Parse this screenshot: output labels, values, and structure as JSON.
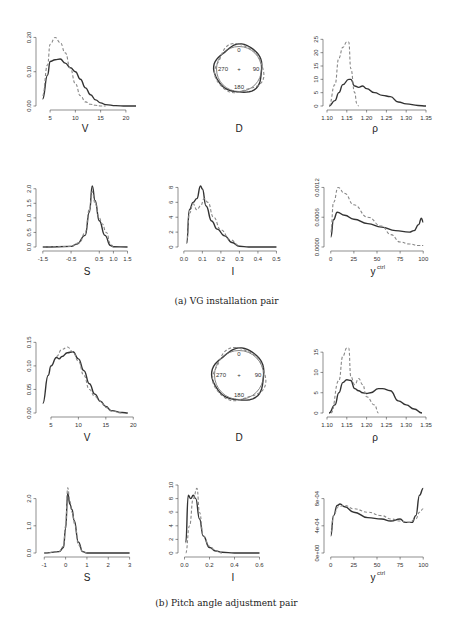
{
  "captions": {
    "a": "(a) VG installation pair",
    "b": "(b) Pitch angle adjustment pair"
  },
  "panels": {
    "a_V": {
      "xlabel": "V"
    },
    "a_D": {
      "xlabel": "D",
      "compass": [
        "0",
        "90",
        "180",
        "270"
      ]
    },
    "a_rho": {
      "xlabel": "ρ"
    },
    "a_S": {
      "xlabel": "S"
    },
    "a_I": {
      "xlabel": "I"
    },
    "a_y": {
      "xlabel": "y",
      "xlabel_sup": "ctrl"
    },
    "b_V": {
      "xlabel": "V"
    },
    "b_D": {
      "xlabel": "D",
      "compass": [
        "0",
        "90",
        "180",
        "270"
      ]
    },
    "b_rho": {
      "xlabel": "ρ"
    },
    "b_S": {
      "xlabel": "S"
    },
    "b_I": {
      "xlabel": "I"
    },
    "b_y": {
      "xlabel": "y",
      "xlabel_sup": "ctrl"
    }
  },
  "chart_data": [
    {
      "id": "a_V",
      "type": "line",
      "group": "(a) VG installation pair",
      "xlabel": "V",
      "ylabel": "",
      "xlim": [
        3,
        22
      ],
      "ylim": [
        0,
        0.21
      ],
      "xticks": [
        5,
        10,
        15,
        20
      ],
      "yticks": [
        "0.00",
        "0.10",
        "0.20"
      ],
      "series": [
        {
          "name": "solid",
          "x": [
            3.5,
            4.5,
            5,
            6,
            7,
            8,
            9,
            10,
            11,
            12,
            13,
            14,
            15,
            16,
            18,
            20,
            22
          ],
          "values": [
            0.02,
            0.09,
            0.13,
            0.135,
            0.137,
            0.125,
            0.112,
            0.1,
            0.078,
            0.053,
            0.033,
            0.018,
            0.009,
            0.004,
            0.001,
            0.0,
            0.0
          ]
        },
        {
          "name": "dashed",
          "x": [
            3.5,
            4.5,
            5,
            6,
            7,
            8,
            9,
            10,
            11,
            12,
            13,
            14,
            15,
            16
          ],
          "values": [
            0.03,
            0.12,
            0.18,
            0.2,
            0.185,
            0.155,
            0.11,
            0.065,
            0.03,
            0.012,
            0.005,
            0.002,
            0.0,
            0.0
          ]
        }
      ]
    },
    {
      "id": "a_D",
      "type": "polar",
      "group": "(a) VG installation pair",
      "xlabel": "D",
      "angles": [
        "0",
        "90",
        "180",
        "270"
      ],
      "series": [
        {
          "name": "solid",
          "shape": "near-circular"
        },
        {
          "name": "dashed",
          "shape": "near-circular"
        }
      ]
    },
    {
      "id": "a_rho",
      "type": "line",
      "group": "(a) VG installation pair",
      "xlabel": "ρ",
      "xlim": [
        1.1,
        1.35
      ],
      "ylim": [
        0,
        27
      ],
      "xticks": [
        "1.10",
        "1.15",
        "1.20",
        "1.25",
        "1.30",
        "1.35"
      ],
      "yticks": [
        0,
        5,
        10,
        15,
        20,
        25
      ],
      "series": [
        {
          "name": "solid",
          "x": [
            1.105,
            1.12,
            1.13,
            1.14,
            1.155,
            1.16,
            1.17,
            1.18,
            1.19,
            1.2,
            1.22,
            1.24,
            1.26,
            1.28,
            1.3,
            1.33,
            1.35
          ],
          "values": [
            0,
            2,
            5,
            8,
            10,
            10,
            7.5,
            7,
            7.5,
            6.5,
            5,
            4,
            3.5,
            1.5,
            0.8,
            0.2,
            0
          ]
        },
        {
          "name": "dashed",
          "x": [
            1.105,
            1.12,
            1.13,
            1.14,
            1.15,
            1.155,
            1.16,
            1.17,
            1.175,
            1.18
          ],
          "values": [
            0,
            8,
            18,
            22,
            24,
            24,
            14,
            5,
            1,
            0
          ]
        }
      ]
    },
    {
      "id": "a_S",
      "type": "line",
      "group": "(a) VG installation pair",
      "xlabel": "S",
      "xlim": [
        -1.6,
        1.8
      ],
      "ylim": [
        0,
        2.3
      ],
      "xticks": [
        "-1.5",
        "-0.5",
        "0.5",
        "1.0",
        "1.5"
      ],
      "yticks": [
        "0.0",
        "0.5",
        "1.0",
        "1.5",
        "2.0"
      ],
      "series": [
        {
          "name": "solid",
          "x": [
            -1.5,
            -0.5,
            -0.3,
            0,
            0.15,
            0.25,
            0.35,
            0.5,
            0.7,
            0.9,
            1.0,
            1.5
          ],
          "values": [
            0,
            0.02,
            0.1,
            0.4,
            1.2,
            2.1,
            1.6,
            0.9,
            0.4,
            0.05,
            0.01,
            0
          ]
        },
        {
          "name": "dashed",
          "x": [
            -1.5,
            -0.5,
            -0.2,
            0,
            0.15,
            0.25,
            0.35,
            0.5,
            0.6,
            0.75,
            0.9,
            1.0
          ],
          "values": [
            0,
            0.02,
            0.15,
            0.5,
            1.3,
            1.9,
            1.5,
            1.0,
            0.8,
            0.5,
            0.1,
            0
          ]
        }
      ]
    },
    {
      "id": "a_I",
      "type": "line",
      "group": "(a) VG installation pair",
      "xlabel": "I",
      "xlim": [
        -0.01,
        0.53
      ],
      "ylim": [
        0,
        9
      ],
      "xticks": [
        "0.0",
        "0.1",
        "0.2",
        "0.3",
        "0.4",
        "0.5"
      ],
      "yticks": [
        0,
        2,
        4,
        6,
        8
      ],
      "series": [
        {
          "name": "solid",
          "x": [
            0.015,
            0.03,
            0.05,
            0.07,
            0.09,
            0.1,
            0.12,
            0.15,
            0.18,
            0.22,
            0.26,
            0.3,
            0.35,
            0.5
          ],
          "values": [
            0.5,
            5,
            6,
            6.5,
            8.2,
            7.8,
            5.5,
            3.5,
            2.4,
            1.5,
            0.6,
            0.1,
            0,
            0
          ]
        },
        {
          "name": "dashed",
          "x": [
            0.015,
            0.03,
            0.05,
            0.07,
            0.09,
            0.11,
            0.13,
            0.16,
            0.2,
            0.25,
            0.3
          ],
          "values": [
            0.5,
            4.5,
            5.8,
            5,
            5.5,
            6.5,
            6,
            4,
            2.3,
            1,
            0.2
          ]
        }
      ]
    },
    {
      "id": "a_y",
      "type": "line",
      "group": "(a) VG installation pair",
      "xlabel": "y^ctrl",
      "xlim": [
        -3,
        103
      ],
      "ylim": [
        0,
        0.00135
      ],
      "xticks": [
        0,
        25,
        50,
        75,
        100
      ],
      "yticks": [
        "0.0000",
        "0.0006",
        "0.0012"
      ],
      "series": [
        {
          "name": "solid",
          "x": [
            0,
            3,
            7,
            15,
            25,
            40,
            55,
            70,
            85,
            90,
            95,
            98,
            100
          ],
          "values": [
            0.0002,
            0.00055,
            0.0007,
            0.00064,
            0.00056,
            0.00047,
            0.0004,
            0.00033,
            0.0003,
            0.00033,
            0.00045,
            0.00058,
            0.0005
          ]
        },
        {
          "name": "dashed",
          "x": [
            0,
            3,
            8,
            15,
            25,
            40,
            55,
            65,
            75,
            85,
            95,
            100
          ],
          "values": [
            0.0003,
            0.0009,
            0.0012,
            0.00108,
            0.00085,
            0.0006,
            0.00042,
            0.00025,
            0.0001,
            6e-05,
            3e-05,
            3e-05
          ]
        }
      ]
    },
    {
      "id": "b_V",
      "type": "line",
      "group": "(b) Pitch angle adjustment pair",
      "xlabel": "V",
      "xlim": [
        3,
        20.5
      ],
      "ylim": [
        0,
        0.155
      ],
      "xticks": [
        5,
        10,
        15,
        20
      ],
      "yticks": [
        "0.00",
        "0.05",
        "0.10",
        "0.15"
      ],
      "series": [
        {
          "name": "solid",
          "x": [
            3.5,
            4.5,
            5,
            6,
            6.5,
            7,
            8,
            9,
            10,
            11,
            12,
            13,
            14,
            15,
            16,
            18,
            19
          ],
          "values": [
            0.02,
            0.08,
            0.1,
            0.118,
            0.115,
            0.12,
            0.128,
            0.13,
            0.115,
            0.09,
            0.062,
            0.04,
            0.025,
            0.014,
            0.005,
            0.001,
            0
          ]
        },
        {
          "name": "dashed",
          "x": [
            6,
            7,
            8,
            9,
            10,
            11,
            12,
            13,
            14,
            15,
            16,
            18
          ],
          "values": [
            0.12,
            0.135,
            0.14,
            0.13,
            0.11,
            0.08,
            0.05,
            0.035,
            0.025,
            0.012,
            0.004,
            0
          ]
        }
      ]
    },
    {
      "id": "b_D",
      "type": "polar",
      "group": "(b) Pitch angle adjustment pair",
      "xlabel": "D",
      "angles": [
        "0",
        "90",
        "180",
        "270"
      ],
      "series": [
        {
          "name": "solid",
          "shape": "near-circular"
        },
        {
          "name": "dashed",
          "shape": "near-circular"
        }
      ]
    },
    {
      "id": "b_rho",
      "type": "line",
      "group": "(b) Pitch angle adjustment pair",
      "xlabel": "ρ",
      "xlim": [
        1.1,
        1.35
      ],
      "ylim": [
        0,
        18
      ],
      "xticks": [
        "1.10",
        "1.15",
        "1.20",
        "1.25",
        "1.30",
        "1.35"
      ],
      "yticks": [
        0,
        5,
        10,
        15
      ],
      "series": [
        {
          "name": "solid",
          "x": [
            1.105,
            1.12,
            1.13,
            1.14,
            1.15,
            1.16,
            1.17,
            1.18,
            1.19,
            1.2,
            1.21,
            1.23,
            1.24,
            1.26,
            1.28,
            1.3,
            1.32,
            1.34
          ],
          "values": [
            0,
            2,
            5,
            7.5,
            8.2,
            8,
            6,
            5.5,
            5,
            4.8,
            5,
            6,
            6,
            5.5,
            3,
            2,
            1,
            0
          ]
        },
        {
          "name": "dashed",
          "x": [
            1.11,
            1.13,
            1.14,
            1.15,
            1.155,
            1.16,
            1.17,
            1.18,
            1.19,
            1.2,
            1.22,
            1.23
          ],
          "values": [
            0,
            8,
            14,
            16,
            16,
            9,
            7,
            8.5,
            7,
            4,
            2,
            0
          ]
        }
      ]
    },
    {
      "id": "b_S",
      "type": "line",
      "group": "(b) Pitch angle adjustment pair",
      "xlabel": "S",
      "xlim": [
        -1.2,
        3.3
      ],
      "ylim": [
        0,
        2.5
      ],
      "xticks": [
        -1,
        0,
        1,
        2,
        3
      ],
      "yticks": [
        "0.0",
        "1.0",
        "2.0"
      ],
      "series": [
        {
          "name": "solid",
          "x": [
            -1,
            -0.3,
            -0.1,
            0,
            0.1,
            0.2,
            0.3,
            0.4,
            0.6,
            0.8,
            1,
            2,
            3
          ],
          "values": [
            0,
            0.05,
            0.2,
            0.9,
            2.2,
            1.8,
            1.6,
            1.2,
            0.4,
            0.05,
            0,
            0,
            0
          ]
        },
        {
          "name": "dashed",
          "x": [
            -1,
            -0.3,
            -0.1,
            0,
            0.1,
            0.2,
            0.3,
            0.45,
            0.6,
            0.8,
            1
          ],
          "values": [
            0,
            0.05,
            0.25,
            1.0,
            2.4,
            1.9,
            1.5,
            1.0,
            0.3,
            0.05,
            0
          ]
        }
      ]
    },
    {
      "id": "b_I",
      "type": "line",
      "group": "(b) Pitch angle adjustment pair",
      "xlabel": "I",
      "xlim": [
        -0.02,
        0.78
      ],
      "ylim": [
        0,
        10
      ],
      "xticks": [
        "0.0",
        "0.2",
        "0.4",
        "0.6"
      ],
      "yticks": [
        0,
        2,
        4,
        6,
        8,
        10
      ],
      "series": [
        {
          "name": "solid",
          "x": [
            0.01,
            0.03,
            0.05,
            0.07,
            0.09,
            0.12,
            0.15,
            0.2,
            0.25,
            0.3,
            0.4,
            0.6
          ],
          "values": [
            1.5,
            8.5,
            8,
            8.5,
            8,
            5,
            2.5,
            0.8,
            0.3,
            0.1,
            0,
            0
          ]
        },
        {
          "name": "dashed",
          "x": [
            0.01,
            0.04,
            0.07,
            0.1,
            0.12,
            0.15,
            0.2,
            0.25,
            0.3
          ],
          "values": [
            0,
            4,
            8,
            9.5,
            6,
            2.5,
            1,
            0.3,
            0
          ]
        }
      ]
    },
    {
      "id": "b_y",
      "type": "line",
      "group": "(b) Pitch angle adjustment pair",
      "xlabel": "y^ctrl",
      "xlim": [
        -3,
        103
      ],
      "ylim": [
        0,
        0.001
      ],
      "xticks": [
        0,
        25,
        50,
        75,
        100
      ],
      "yticks": [
        "0e+00",
        "4e-04",
        "8e-04"
      ],
      "series": [
        {
          "name": "solid",
          "x": [
            0,
            3,
            7,
            10,
            15,
            25,
            40,
            55,
            65,
            75,
            80,
            88,
            92,
            96,
            100
          ],
          "values": [
            0.00025,
            0.00055,
            0.0007,
            0.00072,
            0.00068,
            0.0006,
            0.00052,
            0.0005,
            0.00047,
            0.0005,
            0.00045,
            0.00045,
            0.00055,
            0.00085,
            0.00095
          ]
        },
        {
          "name": "dashed",
          "x": [
            0,
            3,
            8,
            15,
            25,
            40,
            55,
            65,
            75,
            85,
            92,
            96,
            100
          ],
          "values": [
            0.0003,
            0.00055,
            0.00068,
            0.0007,
            0.00065,
            0.0006,
            0.00055,
            0.0005,
            0.00047,
            0.00045,
            0.0005,
            0.0006,
            0.00065
          ]
        }
      ]
    }
  ]
}
